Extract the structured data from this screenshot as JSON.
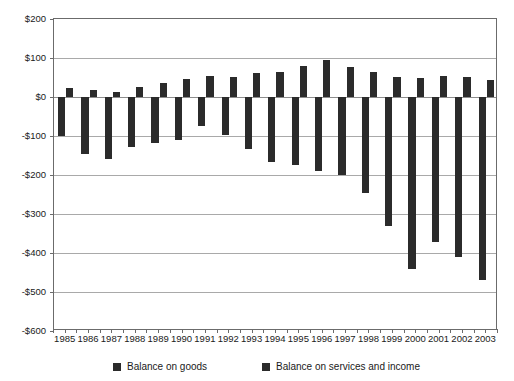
{
  "chart_data": {
    "type": "bar",
    "title": "",
    "subtitle": "",
    "xlabel": "",
    "ylabel": "",
    "ylim": [
      -600,
      200
    ],
    "ytick_values": [
      200,
      100,
      0,
      -100,
      -200,
      -300,
      -400,
      -500,
      -600
    ],
    "ytick_labels": [
      "$200",
      "$100",
      "$0",
      "-$100",
      "-$200",
      "-$300",
      "-$400",
      "-$500",
      "-$600"
    ],
    "grid": true,
    "legend_position": "bottom",
    "units": "billions of U.S. dollars",
    "categories": [
      "1985",
      "1986",
      "1987",
      "1988",
      "1989",
      "1990",
      "1991",
      "1992",
      "1993",
      "1994",
      "1995",
      "1996",
      "1997",
      "1998",
      "1999",
      "2000",
      "2001",
      "2002",
      "2003"
    ],
    "series": [
      {
        "name": "Balance on goods",
        "color": "#2b2b2b",
        "values": [
          -100,
          -145,
          -160,
          -127,
          -117,
          -111,
          -75,
          -97,
          -133,
          -166,
          -174,
          -191,
          -199,
          -247,
          -332,
          -440,
          -371,
          -410,
          -470
        ]
      },
      {
        "name": "Balance on services and income",
        "color": "#2b2b2b",
        "values": [
          22,
          17,
          13,
          25,
          37,
          47,
          55,
          52,
          62,
          65,
          80,
          95,
          78,
          65,
          52,
          50,
          53,
          52,
          43
        ]
      }
    ]
  },
  "legend": {
    "entries": [
      {
        "label": "Balance on goods",
        "swatch_name": "legend-swatch-goods"
      },
      {
        "label": "Balance on services and income",
        "swatch_name": "legend-swatch-services"
      }
    ]
  }
}
